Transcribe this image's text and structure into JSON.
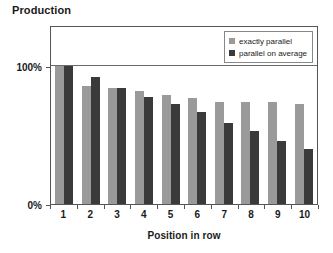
{
  "chart_data": {
    "type": "bar",
    "title": "Production",
    "xlabel": "Position in row",
    "ylabel": "",
    "categories": [
      "1",
      "2",
      "3",
      "4",
      "5",
      "6",
      "7",
      "8",
      "9",
      "10"
    ],
    "series": [
      {
        "name": "exactly parallel",
        "color": "#9a9a9a",
        "values": [
          100,
          86,
          84,
          82,
          79,
          77,
          74,
          74,
          74,
          73
        ]
      },
      {
        "name": "parallel on average",
        "color": "#3a3a3a",
        "values": [
          100,
          92,
          84,
          78,
          73,
          67,
          59,
          53,
          46,
          40
        ]
      }
    ],
    "ylim": [
      0,
      130
    ],
    "yticks": [
      0,
      100
    ],
    "ytick_labels": [
      "0%",
      "100%"
    ],
    "grid": true,
    "gridlines_at": [
      100
    ],
    "legend_position": "top-right",
    "legend_entries": [
      "exactly parallel",
      "parallel on average"
    ]
  }
}
